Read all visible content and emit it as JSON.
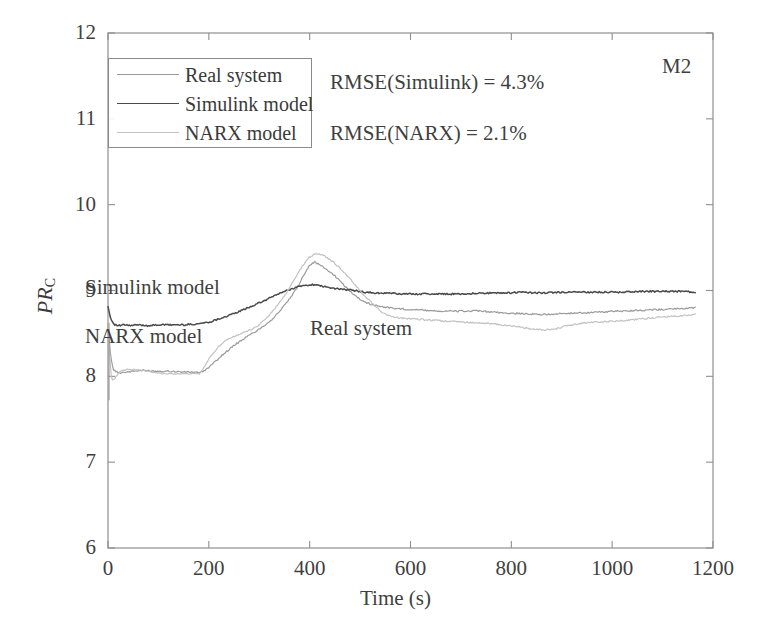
{
  "figure": {
    "corner_tag": "M2",
    "annotations": [
      {
        "name": "rmse-simulink",
        "text": "RMSE(Simulink) = 4.3%",
        "x": 330,
        "y": 72
      },
      {
        "name": "rmse-narx",
        "text": "RMSE(NARX) = 2.1%",
        "x": 330,
        "y": 123
      },
      {
        "name": "curve-label-simulink",
        "text": "Simulink model",
        "x": 85,
        "y": 277
      },
      {
        "name": "curve-label-narx",
        "text": "NARX model",
        "x": 85,
        "y": 326
      },
      {
        "name": "curve-label-real",
        "text": "Real system",
        "x": 310,
        "y": 318
      }
    ]
  },
  "legend": {
    "position": "top-left",
    "items": [
      {
        "label": "Real system",
        "color": "#9a9a9a",
        "width": 1.3
      },
      {
        "label": "Simulink model",
        "color": "#4a4a4a",
        "width": 1.6
      },
      {
        "label": "NARX model",
        "color": "#c2c2c2",
        "width": 1.3
      }
    ]
  },
  "chart_data": {
    "type": "line",
    "title": "",
    "subtitle": "",
    "xlabel": "Time (s)",
    "ylabel": "PR_C",
    "ylabel_base": "PR",
    "ylabel_sub": "C",
    "xlim": [
      0,
      1200
    ],
    "ylim": [
      6,
      12
    ],
    "xticks": [
      0,
      200,
      400,
      600,
      800,
      1000,
      1200
    ],
    "yticks": [
      6,
      7,
      8,
      9,
      10,
      11,
      12
    ],
    "xticklabels": [
      "0",
      "200",
      "400",
      "600",
      "800",
      "1000",
      "1200"
    ],
    "yticklabels": [
      "6",
      "7",
      "8",
      "9",
      "10",
      "11",
      "12"
    ],
    "grid": false,
    "legend_position": "upper left",
    "annotations_text": [
      "RMSE(Simulink) = 4.3%",
      "RMSE(NARX) = 2.1%",
      "M2",
      "Simulink model",
      "NARX model",
      "Real system"
    ],
    "series": [
      {
        "name": "Real system",
        "color": "#9a9a9a",
        "x": [
          0,
          5,
          10,
          20,
          35,
          50,
          70,
          95,
          120,
          150,
          175,
          182,
          190,
          205,
          225,
          250,
          275,
          300,
          325,
          345,
          360,
          375,
          390,
          400,
          410,
          420,
          435,
          450,
          470,
          490,
          505,
          520,
          545,
          570,
          600,
          630,
          660,
          700,
          740,
          780,
          820,
          860,
          900,
          940,
          980,
          1020,
          1060,
          1100,
          1140,
          1165
        ],
        "y": [
          8.62,
          8.25,
          8.08,
          8.04,
          8.05,
          8.06,
          8.07,
          8.06,
          8.06,
          8.05,
          8.05,
          8.04,
          8.06,
          8.13,
          8.24,
          8.36,
          8.46,
          8.55,
          8.66,
          8.79,
          8.9,
          9.03,
          9.2,
          9.3,
          9.33,
          9.3,
          9.24,
          9.17,
          9.05,
          8.94,
          8.88,
          8.84,
          8.81,
          8.79,
          8.78,
          8.77,
          8.76,
          8.76,
          8.76,
          8.74,
          8.73,
          8.72,
          8.73,
          8.74,
          8.75,
          8.76,
          8.77,
          8.78,
          8.79,
          8.8
        ]
      },
      {
        "name": "Simulink model",
        "color": "#4a4a4a",
        "x": [
          0,
          4,
          8,
          14,
          22,
          32,
          45,
          60,
          80,
          100,
          125,
          150,
          175,
          200,
          225,
          250,
          270,
          290,
          310,
          330,
          350,
          365,
          380,
          395,
          405,
          415,
          425,
          440,
          455,
          470,
          490,
          510,
          530,
          555,
          580,
          610,
          640,
          670,
          700,
          740,
          780,
          820,
          860,
          900,
          940,
          980,
          1020,
          1060,
          1100,
          1140,
          1165
        ],
        "y": [
          8.82,
          8.7,
          8.64,
          8.6,
          8.59,
          8.6,
          8.59,
          8.6,
          8.59,
          8.6,
          8.6,
          8.6,
          8.61,
          8.63,
          8.68,
          8.73,
          8.78,
          8.83,
          8.88,
          8.94,
          8.99,
          9.02,
          9.05,
          9.06,
          9.07,
          9.06,
          9.05,
          9.03,
          9.02,
          9.01,
          9.0,
          8.98,
          8.97,
          8.97,
          8.96,
          8.96,
          8.96,
          8.96,
          8.96,
          8.97,
          8.97,
          8.98,
          8.97,
          8.98,
          8.98,
          8.98,
          8.98,
          8.99,
          8.99,
          8.99,
          8.98
        ]
      },
      {
        "name": "NARX model",
        "color": "#c2c2c2",
        "x": [
          0,
          3,
          6,
          10,
          16,
          25,
          38,
          55,
          75,
          95,
          115,
          135,
          155,
          172,
          182,
          190,
          200,
          215,
          235,
          255,
          275,
          295,
          315,
          335,
          355,
          372,
          385,
          398,
          408,
          418,
          430,
          445,
          460,
          478,
          495,
          512,
          530,
          545,
          560,
          580,
          600,
          625,
          650,
          680,
          710,
          745,
          780,
          810,
          840,
          860,
          885,
          905,
          920,
          940,
          960,
          1000,
          1040,
          1080,
          1120,
          1150,
          1165
        ],
        "y": [
          8.7,
          8.3,
          8.0,
          7.95,
          8.0,
          8.06,
          8.08,
          8.08,
          8.06,
          8.04,
          8.03,
          8.03,
          8.03,
          8.03,
          8.03,
          8.1,
          8.2,
          8.32,
          8.42,
          8.48,
          8.52,
          8.58,
          8.68,
          8.82,
          8.98,
          9.15,
          9.28,
          9.38,
          9.42,
          9.43,
          9.4,
          9.34,
          9.26,
          9.15,
          9.03,
          8.92,
          8.82,
          8.74,
          8.7,
          8.68,
          8.67,
          8.66,
          8.65,
          8.64,
          8.63,
          8.62,
          8.6,
          8.58,
          8.55,
          8.54,
          8.55,
          8.58,
          8.6,
          8.62,
          8.63,
          8.64,
          8.66,
          8.68,
          8.7,
          8.71,
          8.72
        ]
      }
    ]
  }
}
